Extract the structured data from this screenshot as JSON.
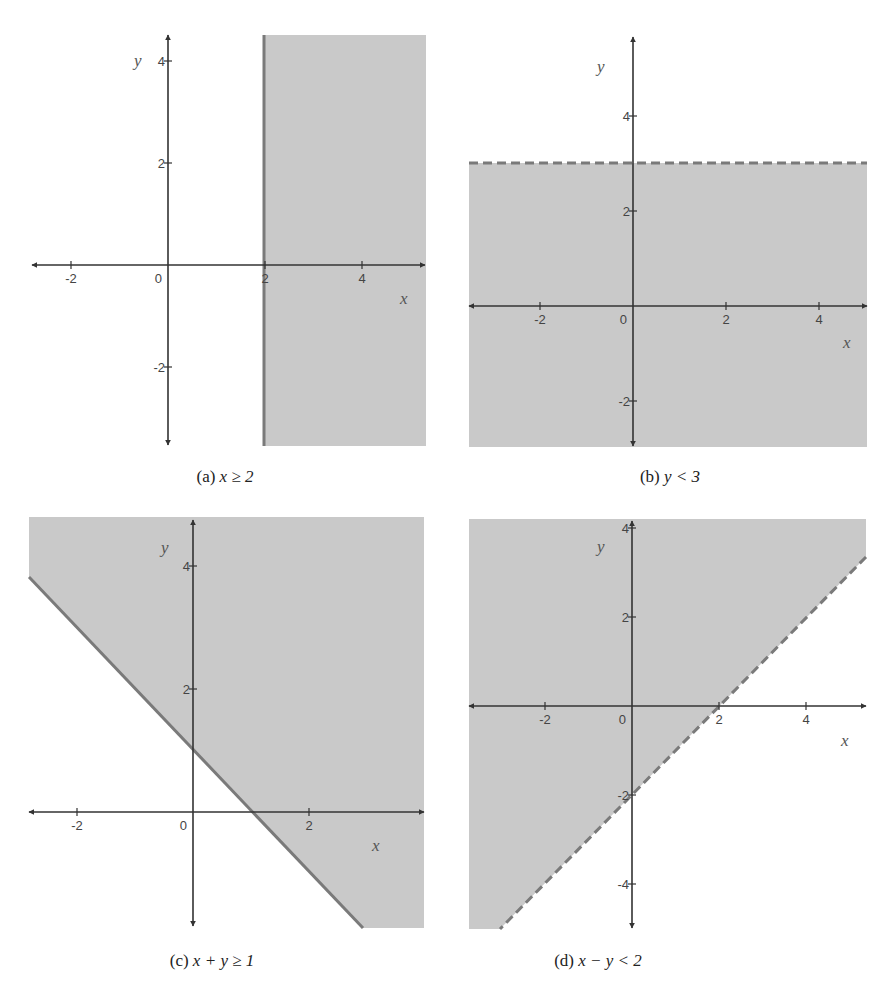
{
  "style": {
    "shade_color": "#c9c9c9",
    "boundary_color": "#7a7a7a",
    "axis_color": "#333333"
  },
  "panels": [
    {
      "id": "a",
      "caption_prefix": "(a)",
      "caption_expr": "x ≥ 2",
      "caption_pos": [
        225,
        467
      ],
      "inequality": "x >= 2",
      "boundary": {
        "equation": "x = 2",
        "style": "solid"
      },
      "origin_px": [
        168,
        265
      ],
      "unit_px": [
        48.5,
        51
      ],
      "shade_rect": [
        264,
        35,
        426,
        446
      ],
      "shade_polygon": [
        [
          264,
          35
        ],
        [
          426,
          35
        ],
        [
          426,
          446
        ],
        [
          264,
          446
        ]
      ],
      "boundary_line_px": [
        [
          264,
          35
        ],
        [
          264,
          446
        ]
      ],
      "x_axis_px": [
        32,
        425
      ],
      "y_axis_px": [
        35,
        445
      ],
      "x_ticks": [
        {
          "v": -2,
          "label": "-2"
        },
        {
          "v": 2,
          "label": "2"
        },
        {
          "v": 4,
          "label": "4"
        }
      ],
      "y_ticks": [
        {
          "v": 4,
          "label": "4"
        },
        {
          "v": 2,
          "label": "2"
        },
        {
          "v": -2,
          "label": "-2"
        }
      ],
      "origin_label": "0",
      "x_var": "x",
      "y_var": "y",
      "x_var_pos": [
        400,
        304
      ],
      "y_var_pos": [
        134,
        66
      ]
    },
    {
      "id": "b",
      "caption_prefix": "(b)",
      "caption_expr": "y < 3",
      "caption_pos": [
        670,
        467
      ],
      "inequality": "y < 3",
      "boundary": {
        "equation": "y = 3",
        "style": "dashed"
      },
      "origin_px": [
        633,
        306
      ],
      "unit_px": [
        46.5,
        47.5
      ],
      "shade_polygon": [
        [
          469,
          163
        ],
        [
          867,
          163
        ],
        [
          867,
          447
        ],
        [
          469,
          447
        ]
      ],
      "boundary_line_px": [
        [
          469,
          163
        ],
        [
          867,
          163
        ]
      ],
      "x_axis_px": [
        469,
        867
      ],
      "y_axis_px": [
        37,
        446
      ],
      "x_ticks": [
        {
          "v": -2,
          "label": "-2"
        },
        {
          "v": 2,
          "label": "2"
        },
        {
          "v": 4,
          "label": "4"
        }
      ],
      "y_ticks": [
        {
          "v": 4,
          "label": "4"
        },
        {
          "v": 2,
          "label": "2"
        },
        {
          "v": -2,
          "label": "-2"
        }
      ],
      "origin_label": "0",
      "x_var": "x",
      "y_var": "y",
      "x_var_pos": [
        843,
        348
      ],
      "y_var_pos": [
        597,
        72
      ]
    },
    {
      "id": "c",
      "caption_prefix": "(c)",
      "caption_expr": "x + y ≥ 1",
      "caption_pos": [
        212,
        951
      ],
      "inequality": "x + y >= 1",
      "boundary": {
        "equation": "x + y = 1",
        "style": "solid"
      },
      "origin_px": [
        193,
        812
      ],
      "unit_px": [
        58,
        61.5
      ],
      "shade_polygon": [
        [
          29,
          517
        ],
        [
          424,
          517
        ],
        [
          424,
          928
        ],
        [
          363,
          928
        ],
        [
          29,
          577
        ]
      ],
      "boundary_line_px": [
        [
          29,
          577
        ],
        [
          363,
          928
        ]
      ],
      "x_axis_px": [
        29,
        424
      ],
      "y_axis_px": [
        520,
        926
      ],
      "x_ticks": [
        {
          "v": -2,
          "label": "-2"
        },
        {
          "v": 2,
          "label": "2"
        }
      ],
      "y_ticks": [
        {
          "v": 4,
          "label": "4"
        },
        {
          "v": 2,
          "label": "2"
        }
      ],
      "origin_label": "0",
      "x_var": "x",
      "y_var": "y",
      "x_var_pos": [
        372,
        851
      ],
      "y_var_pos": [
        161,
        553
      ]
    },
    {
      "id": "d",
      "caption_prefix": "(d)",
      "caption_expr": "x − y < 2",
      "caption_pos": [
        598,
        951
      ],
      "inequality": "x - y < 2",
      "boundary": {
        "equation": "x - y = 2",
        "style": "dashed"
      },
      "origin_px": [
        632,
        706
      ],
      "unit_px": [
        43.5,
        44.5
      ],
      "shade_polygon": [
        [
          469,
          519
        ],
        [
          866,
          519
        ],
        [
          866,
          557
        ],
        [
          500,
          929
        ],
        [
          469,
          929
        ]
      ],
      "boundary_line_px": [
        [
          866,
          557
        ],
        [
          500,
          929
        ]
      ],
      "x_axis_px": [
        469,
        866
      ],
      "y_axis_px": [
        521,
        928
      ],
      "x_ticks": [
        {
          "v": -2,
          "label": "-2"
        },
        {
          "v": 2,
          "label": "2"
        },
        {
          "v": 4,
          "label": "4"
        }
      ],
      "y_ticks": [
        {
          "v": 4,
          "label": "4"
        },
        {
          "v": 2,
          "label": "2"
        },
        {
          "v": -2,
          "label": "-2"
        },
        {
          "v": -4,
          "label": "-4"
        }
      ],
      "origin_label": "0",
      "x_var": "x",
      "y_var": "y",
      "x_var_pos": [
        841,
        746
      ],
      "y_var_pos": [
        597,
        552
      ]
    }
  ],
  "chart_data": [
    {
      "type": "area",
      "title": "(a) x ≥ 2",
      "xlabel": "x",
      "ylabel": "y",
      "xlim": [
        -2.8,
        5.3
      ],
      "ylim": [
        -3.5,
        4.5
      ],
      "x_ticks": [
        -2,
        0,
        2,
        4
      ],
      "y_ticks": [
        -2,
        2,
        4
      ],
      "boundary": {
        "equation": "x = 2",
        "line": "solid",
        "included": true
      },
      "shaded_region": "x >= 2 (right of line)",
      "grid": false
    },
    {
      "type": "area",
      "title": "(b) y < 3",
      "xlabel": "x",
      "ylabel": "y",
      "xlim": [
        -3.5,
        5.0
      ],
      "ylim": [
        -3.0,
        5.7
      ],
      "x_ticks": [
        -2,
        0,
        2,
        4
      ],
      "y_ticks": [
        -2,
        2,
        4
      ],
      "boundary": {
        "equation": "y = 3",
        "line": "dashed",
        "included": false
      },
      "shaded_region": "y < 3 (below line)",
      "grid": false
    },
    {
      "type": "area",
      "title": "(c) x + y ≥ 1",
      "xlabel": "x",
      "ylabel": "y",
      "xlim": [
        -2.8,
        4.0
      ],
      "ylim": [
        -1.9,
        4.8
      ],
      "x_ticks": [
        -2,
        0,
        2
      ],
      "y_ticks": [
        2,
        4
      ],
      "boundary": {
        "equation": "x + y = 1",
        "line": "solid",
        "included": true,
        "points": [
          [
            0,
            1
          ],
          [
            1,
            0
          ]
        ]
      },
      "shaded_region": "x + y >= 1 (above/right of line)",
      "grid": false
    },
    {
      "type": "area",
      "title": "(d) x − y < 2",
      "xlabel": "x",
      "ylabel": "y",
      "xlim": [
        -3.7,
        5.4
      ],
      "ylim": [
        -5.0,
        4.2
      ],
      "x_ticks": [
        -2,
        0,
        2,
        4
      ],
      "y_ticks": [
        -4,
        -2,
        2,
        4
      ],
      "boundary": {
        "equation": "x - y = 2",
        "line": "dashed",
        "included": false,
        "points": [
          [
            0,
            -2
          ],
          [
            2,
            0
          ]
        ]
      },
      "shaded_region": "x - y < 2 (above/left of line)",
      "grid": false
    }
  ]
}
